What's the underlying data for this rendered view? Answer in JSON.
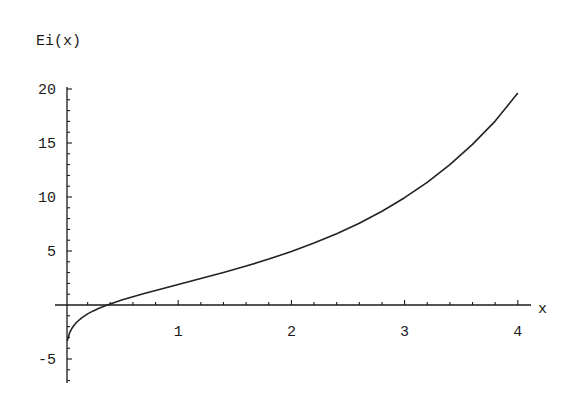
{
  "chart_data": {
    "type": "line",
    "title": "",
    "xlabel": "x",
    "ylabel": "Ei(x)",
    "xlim": [
      0,
      4
    ],
    "ylim": [
      -7,
      20
    ],
    "grid": false,
    "legend": null,
    "x_ticks": [
      1,
      2,
      3,
      4
    ],
    "x_tick_labels": [
      "1",
      "2",
      "3",
      "4"
    ],
    "x_minor_step": 0.2,
    "y_ticks": [
      -5,
      5,
      10,
      15,
      20
    ],
    "y_tick_labels": [
      "-5",
      "5",
      "10",
      "15",
      "20"
    ],
    "y_minor_step": 1,
    "series": [
      {
        "name": "Ei(x)",
        "x": [
          0.02,
          0.04,
          0.06,
          0.08,
          0.1,
          0.15,
          0.2,
          0.25,
          0.3,
          0.3725,
          0.4,
          0.5,
          0.6,
          0.7,
          0.8,
          0.9,
          1.0,
          1.2,
          1.4,
          1.6,
          1.8,
          2.0,
          2.2,
          2.4,
          2.6,
          2.8,
          3.0,
          3.2,
          3.4,
          3.6,
          3.8,
          4.0
        ],
        "values": [
          -3.314,
          -2.605,
          -2.18,
          -1.873,
          -1.623,
          -1.164,
          -0.822,
          -0.543,
          -0.302,
          0.0,
          0.105,
          0.455,
          0.77,
          1.065,
          1.347,
          1.623,
          1.895,
          2.442,
          3.007,
          3.605,
          4.25,
          4.954,
          5.733,
          6.601,
          7.577,
          8.68,
          9.934,
          11.363,
          12.998,
          14.872,
          17.025,
          19.631
        ]
      }
    ]
  },
  "labels": {
    "y_axis": "Ei(x)",
    "x_axis": "x"
  },
  "colors": {
    "curve": "#222222",
    "axes": "#1a1a1a",
    "background": "#ffffff"
  }
}
